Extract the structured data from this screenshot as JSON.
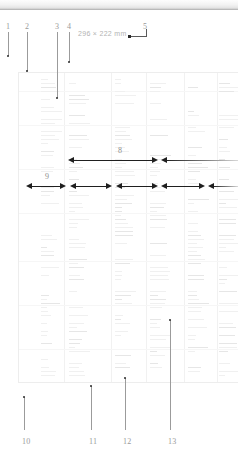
{
  "figure": {
    "dimension_note": "296 × 222 mm",
    "page_background": "#ffffff",
    "accent_color": "#1f1f1f",
    "leader_color": "#9b9b9b",
    "label_color": "#9a9a9a"
  },
  "top_callouts": [
    {
      "label": "1",
      "x": 6,
      "label_y": 22,
      "line_top": 32,
      "line_bottom": 56,
      "dot_y": 56
    },
    {
      "label": "2",
      "x": 25,
      "label_y": 22,
      "line_top": 32,
      "line_bottom": 71,
      "dot_y": 71
    },
    {
      "label": "3",
      "x": 55,
      "label_y": 22,
      "line_top": 32,
      "line_bottom": 98,
      "dot_y": 98
    },
    {
      "label": "4",
      "x": 67,
      "label_y": 22,
      "line_top": 32,
      "line_bottom": 62,
      "dot_y": 62
    },
    {
      "label": "5",
      "x": 143,
      "label_y": 22,
      "line_top": 0,
      "line_bottom": 0,
      "dot_y": 0
    }
  ],
  "bottom_callouts": [
    {
      "label": "10",
      "x": 22,
      "label_y": 437,
      "line_top": 397,
      "line_bottom": 430,
      "dot_y": 397
    },
    {
      "label": "11",
      "x": 89,
      "label_y": 437,
      "line_top": 386,
      "line_bottom": 430,
      "dot_y": 386
    },
    {
      "label": "12",
      "x": 123,
      "label_y": 437,
      "line_top": 378,
      "line_bottom": 430,
      "dot_y": 378
    },
    {
      "label": "13",
      "x": 168,
      "label_y": 437,
      "line_top": 320,
      "line_bottom": 430,
      "dot_y": 320
    }
  ],
  "dimension_rows": [
    {
      "name": "row-8",
      "label": "8",
      "label_x": 118,
      "y": 155,
      "segments": [
        {
          "x": 68,
          "width": 90,
          "left_head": true,
          "right_head": true,
          "fade": false
        },
        {
          "x": 161,
          "width": 77,
          "left_head": true,
          "right_head": false,
          "fade": true
        }
      ]
    },
    {
      "name": "row-9",
      "label": "9",
      "label_x": 45,
      "y": 181,
      "segments": [
        {
          "x": 26,
          "width": 40,
          "left_head": true,
          "right_head": true,
          "fade": false
        },
        {
          "x": 70,
          "width": 42,
          "left_head": true,
          "right_head": true,
          "fade": false
        },
        {
          "x": 116,
          "width": 42,
          "left_head": true,
          "right_head": true,
          "fade": false
        },
        {
          "x": 161,
          "width": 44,
          "left_head": true,
          "right_head": true,
          "fade": false
        },
        {
          "x": 208,
          "width": 30,
          "left_head": true,
          "right_head": false,
          "fade": true
        }
      ]
    }
  ],
  "document_panel": {
    "name": "spreadsheet-page",
    "left": 18,
    "top": 72,
    "width": 220,
    "height": 311,
    "column_rules_x": [
      45,
      92,
      127,
      165,
      198
    ],
    "row_rules_y": [
      18,
      52,
      96,
      140,
      188,
      232,
      276
    ]
  }
}
